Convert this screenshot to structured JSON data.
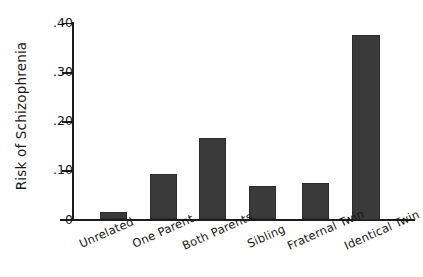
{
  "chart_data": {
    "type": "bar",
    "title": "",
    "xlabel": "",
    "ylabel": "Risk of Schizophrenia",
    "categories": [
      "Unrelated",
      "One Parent",
      "Both Parents",
      "Sibling",
      "Fraternal Twin",
      "Identical Twin"
    ],
    "values": [
      0.015,
      0.093,
      0.166,
      0.068,
      0.074,
      0.375
    ],
    "ylim": [
      0,
      0.4
    ],
    "ytick_values": [
      0.4,
      0.3,
      0.2,
      0.1,
      0
    ],
    "ytick_labels": [
      ".40",
      ".30",
      ".20",
      ".10",
      "0"
    ],
    "grid": false,
    "legend": false,
    "bar_color": "#3a3a3a",
    "axis_color": "#1c1c1c",
    "background": "#ffffff"
  }
}
